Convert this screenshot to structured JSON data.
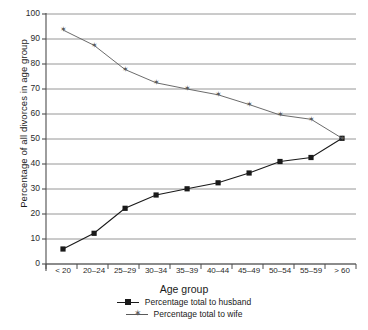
{
  "chart_data": {
    "type": "line",
    "title": "",
    "xlabel": "Age group",
    "ylabel": "Percentage of all divorces in age group",
    "categories": [
      "< 20",
      "20–24",
      "25–29",
      "30–34",
      "35–39",
      "40–44",
      "45–49",
      "50–54",
      "55–59",
      "> 60"
    ],
    "ylim": [
      0,
      100
    ],
    "yticks": [
      0,
      10,
      20,
      30,
      40,
      50,
      60,
      70,
      80,
      90,
      100
    ],
    "grid": true,
    "legend_position": "bottom",
    "series": [
      {
        "name": "Percentage total to husband",
        "marker": "square",
        "color": "#1a1a1a",
        "values": [
          6,
          12.3,
          22.3,
          27.6,
          30.1,
          32.5,
          36.4,
          41,
          42.6,
          50.3
        ]
      },
      {
        "name": "Percentage total to wife",
        "marker": "star",
        "color": "#5a5a5a",
        "values": [
          93.6,
          87.5,
          77.8,
          72.5,
          70,
          67.7,
          63.8,
          59.6,
          57.9,
          50.3
        ]
      }
    ]
  },
  "axis": {
    "y_title": "Percentage of all divorces in age group",
    "x_title": "Age group"
  },
  "colors": {
    "grid": "#8a8a8a",
    "axis": "#4d4d4d",
    "husband": "#1a1a1a",
    "wife": "#5a5a5a",
    "background": "#ffffff"
  }
}
